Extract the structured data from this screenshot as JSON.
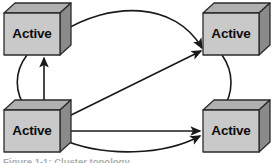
{
  "figure": {
    "type": "node-link-diagram",
    "caption_fragment": "Figure 1-1: Cluster topology"
  },
  "colors": {
    "cube_front": "#c9c9c9",
    "cube_top": "#b0b0b0",
    "cube_side": "#8a8a8a",
    "cube_outline": "#2b2b2b",
    "connector": "#1a1a1a",
    "label_text": "#0d0d0d",
    "background": "#ffffff"
  },
  "nodes": [
    {
      "id": "node-top-left",
      "label": "Active",
      "position": "top-left",
      "front": {
        "x": 4,
        "y": 13,
        "w": 56,
        "h": 42
      },
      "depth": {
        "dx": 11,
        "dy": -10
      },
      "label_x": 32,
      "label_y": 34
    },
    {
      "id": "node-top-right",
      "label": "Active",
      "position": "top-right",
      "front": {
        "x": 203,
        "y": 13,
        "w": 56,
        "h": 42
      },
      "depth": {
        "dx": 11,
        "dy": -10
      },
      "label_x": 231,
      "label_y": 34
    },
    {
      "id": "node-bottom-left",
      "label": "Active",
      "position": "bottom-left",
      "front": {
        "x": 4,
        "y": 110,
        "w": 56,
        "h": 42
      },
      "depth": {
        "dx": 11,
        "dy": -10
      },
      "label_x": 32,
      "label_y": 131
    },
    {
      "id": "node-bottom-right",
      "label": "Active",
      "position": "bottom-right",
      "front": {
        "x": 203,
        "y": 110,
        "w": 56,
        "h": 42
      },
      "depth": {
        "dx": 11,
        "dy": -10
      },
      "label_x": 231,
      "label_y": 131
    }
  ],
  "connectors": [
    {
      "id": "connector-top-arc",
      "from": "node-top-left",
      "to": "node-top-right",
      "style": "curved",
      "arrowhead": true,
      "path": "M 60 33 C 110 1, 175 1, 202 48"
    },
    {
      "id": "connector-left-arc",
      "from": "node-top-left",
      "to": "node-bottom-left",
      "style": "curved",
      "arrowhead": false,
      "path": "M 27 55 C 14 72, 14 92, 27 110"
    },
    {
      "id": "connector-left-vertical",
      "from": "node-bottom-left",
      "to": "node-top-left",
      "style": "straight",
      "arrowhead": true,
      "path": "M 44 110 L 44 58"
    },
    {
      "id": "connector-diagonal",
      "from": "node-bottom-left",
      "to": "node-top-right",
      "style": "straight",
      "arrowhead": true,
      "path": "M 61 120 L 201 51"
    },
    {
      "id": "connector-bottom-straight",
      "from": "node-bottom-left",
      "to": "node-bottom-right",
      "style": "straight",
      "arrowhead": true,
      "path": "M 61 131 L 200 131"
    },
    {
      "id": "connector-bottom-arc",
      "from": "node-bottom-left",
      "to": "node-bottom-right",
      "style": "curved",
      "arrowhead": true,
      "path": "M 61 139 C 105 158, 165 155, 200 136"
    },
    {
      "id": "connector-right-arc",
      "from": "node-top-right",
      "to": "node-bottom-right",
      "style": "curved",
      "arrowhead": false,
      "path": "M 222 55 C 234 72, 234 93, 222 110"
    }
  ]
}
